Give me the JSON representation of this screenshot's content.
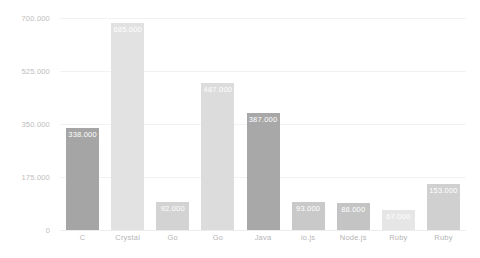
{
  "chart_data": {
    "type": "bar",
    "title": "",
    "subtitle": "",
    "xlabel": "",
    "ylabel": "",
    "categories": [
      "C",
      "Crystal",
      "Go",
      "Go",
      "Java",
      "io.js",
      "Node.js",
      "Ruby",
      "Ruby"
    ],
    "values": [
      338000,
      685000,
      92000,
      487000,
      387000,
      93000,
      88000,
      67000,
      153000
    ],
    "value_labels": [
      "338.000",
      "685.000",
      "92.000",
      "487.000",
      "387.000",
      "93.000",
      "88.000",
      "67.000",
      "153.000"
    ],
    "bar_colors": [
      "#a5a5a5",
      "#e2e2e2",
      "#d3d3d3",
      "#dcdcdc",
      "#a8a8a8",
      "#c9c9c9",
      "#c4c4c4",
      "#e6e6e6",
      "#d0d0d0"
    ],
    "ylim": [
      0,
      700000
    ],
    "ytick_labels": [
      "700.000",
      "525.000",
      "350.000",
      "175.000",
      "0"
    ],
    "ytick_values": [
      700000,
      525000,
      350000,
      175000,
      0
    ],
    "grid": true,
    "legend": "none",
    "gridline_color": "#f2f2f2",
    "axis_label_color": "#bdbdbd",
    "value_label_color": "#ffffff",
    "background_color": "#ffffff"
  }
}
